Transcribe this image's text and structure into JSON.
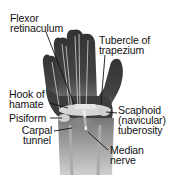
{
  "figure": {
    "colors": {
      "background": "#ffffff",
      "hand_fill": "#3a3a3a",
      "hand_dark": "#2a2a2a",
      "bone_light": "#d9d9d9",
      "tendon": "#e8e8e8",
      "leader_line": "#111111",
      "text": "#111111"
    }
  },
  "labels": {
    "flexor_retinaculum": {
      "line1": "Flexor",
      "line2": "retinaculum"
    },
    "tubercle_of_trapezium": {
      "line1": "Tubercle of",
      "line2": "trapezium"
    },
    "hook_of_hamate": {
      "line1": "Hook of",
      "line2": "hamate"
    },
    "pisiform": {
      "line1": "Pisiform"
    },
    "carpal_tunnel": {
      "line1": "Carpal",
      "line2": "tunnel"
    },
    "scaphoid_tuberosity": {
      "line1": "Scaphoid",
      "line2": "(navicular)",
      "line3": "tuberosity"
    },
    "median_nerve": {
      "line1": "Median",
      "line2": "nerve"
    }
  }
}
